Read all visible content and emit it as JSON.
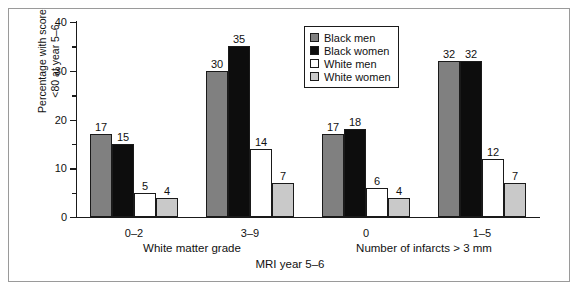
{
  "chart_data": {
    "type": "bar",
    "title": "",
    "subtitle": "",
    "xlabel": "MRI year 5–6",
    "ylabel": "Percentage with score <80 at year 5–6",
    "ylabel_line1": "Percentage with score",
    "ylabel_line2": "<80 at year 5–6",
    "ylim": [
      0,
      40
    ],
    "yticks": [
      0,
      10,
      20,
      30,
      40
    ],
    "ytick_labels": [
      "0",
      "10",
      "20",
      "30",
      "40"
    ],
    "yminor_ticks": [
      5,
      15,
      25,
      35
    ],
    "grid": false,
    "legend_position": "top-right",
    "categories": [
      "0–2",
      "3–9",
      "0",
      "1–5"
    ],
    "group_labels": [
      "White matter grade",
      "Number of infarcts > 3 mm"
    ],
    "group_spans": [
      [
        0,
        1
      ],
      [
        2,
        3
      ]
    ],
    "series": [
      {
        "name": "Black men",
        "color": "#808080",
        "values": [
          17,
          30,
          17,
          32
        ]
      },
      {
        "name": "Black women",
        "color": "#0d0d0d",
        "values": [
          15,
          35,
          18,
          32
        ]
      },
      {
        "name": "White men",
        "color": "#ffffff",
        "values": [
          5,
          14,
          6,
          12
        ]
      },
      {
        "name": "White women",
        "color": "#c9c9c9",
        "values": [
          4,
          7,
          4,
          7
        ]
      }
    ],
    "legend": [
      {
        "label": "Black men",
        "color": "#808080"
      },
      {
        "label": "Black women",
        "color": "#0d0d0d"
      },
      {
        "label": "White men",
        "color": "#ffffff"
      },
      {
        "label": "White women",
        "color": "#c9c9c9"
      }
    ],
    "axis_color": "#1a1a1a",
    "frame_color": "#9a9a9a",
    "background": "#ffffff"
  }
}
